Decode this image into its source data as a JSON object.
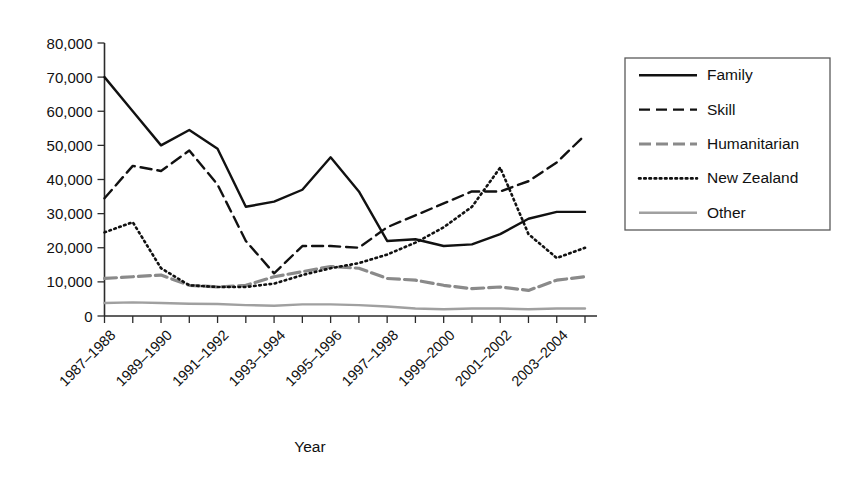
{
  "chart_data": {
    "type": "line",
    "title": "",
    "xlabel": "Year",
    "ylabel": "",
    "grid": false,
    "legend_position": "right",
    "ylim": [
      0,
      80000
    ],
    "ytick_labels": [
      "0",
      "10,000",
      "20,000",
      "30,000",
      "40,000",
      "50,000",
      "60,000",
      "70,000",
      "80,000"
    ],
    "ytick_values": [
      0,
      10000,
      20000,
      30000,
      40000,
      50000,
      60000,
      70000,
      80000
    ],
    "categories": [
      "1987–1988",
      "1988–1989",
      "1989–1990",
      "1990–1991",
      "1991–1992",
      "1992–1993",
      "1993–1994",
      "1994–1995",
      "1995–1996",
      "1996–1997",
      "1997–1998",
      "1998–1999",
      "1999–2000",
      "2000–2001",
      "2001–2002",
      "2002–2003",
      "2003–2004",
      "2004–2005"
    ],
    "xtick_labels_shown": [
      "1987–1988",
      "1989–1990",
      "1991–1992",
      "1993–1994",
      "1995–1996",
      "1997–1998",
      "1999–2000",
      "2001–2002",
      "2003–2004"
    ],
    "series": [
      {
        "name": "Family",
        "style": "solid",
        "color": "#111111",
        "values": [
          70000,
          60000,
          50000,
          54500,
          49000,
          32000,
          33500,
          37000,
          46500,
          36500,
          22000,
          22500,
          20500,
          21000,
          24000,
          28500,
          30500,
          30500
        ]
      },
      {
        "name": "Skill",
        "style": "dashed",
        "color": "#111111",
        "values": [
          34500,
          44000,
          42500,
          48500,
          38500,
          22000,
          12500,
          20500,
          20500,
          20000,
          26000,
          29500,
          33000,
          36500,
          36500,
          39500,
          45000,
          53000
        ]
      },
      {
        "name": "Humanitarian",
        "style": "dashdot",
        "color": "#8a8a8a",
        "values": [
          11000,
          11500,
          12000,
          9000,
          8500,
          9000,
          11500,
          13000,
          14500,
          14000,
          11000,
          10500,
          9000,
          8000,
          8500,
          7500,
          10500,
          11500
        ]
      },
      {
        "name": "New Zealand",
        "style": "dotted",
        "color": "#111111",
        "values": [
          24500,
          27500,
          14000,
          9000,
          8500,
          8500,
          9500,
          12000,
          14000,
          15500,
          18000,
          21500,
          26000,
          32000,
          43500,
          24000,
          17000,
          20000
        ]
      },
      {
        "name": "Other",
        "style": "solid",
        "color": "#a0a0a0",
        "values": [
          3800,
          4000,
          3800,
          3600,
          3500,
          3200,
          3000,
          3400,
          3400,
          3200,
          2800,
          2200,
          2000,
          2200,
          2200,
          2000,
          2200,
          2200
        ]
      }
    ]
  }
}
